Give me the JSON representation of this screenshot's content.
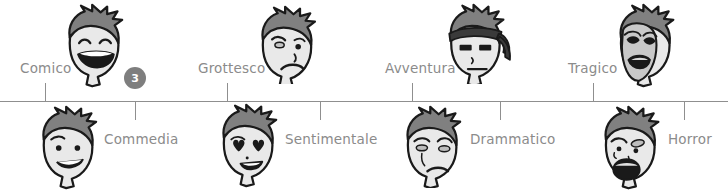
{
  "diagram": {
    "type": "horizontal-scale-timeline",
    "axis_color": "#8f8f8f",
    "label_color": "#8b8b8b",
    "badge_color": "#7e7e7e",
    "skin_color": "#e9e9e9",
    "hair_color": "#808080",
    "outline_color": "#1a1a1a"
  },
  "badge": {
    "value": "3"
  },
  "markers_above": [
    {
      "label": "Comico",
      "tick_x": 45,
      "label_x": 20,
      "label_y": 62,
      "face_x": 62,
      "face_y": 2,
      "face": "laughing-face"
    },
    {
      "label": "Grottesco",
      "tick_x": 227,
      "label_x": 198,
      "label_y": 62,
      "face_x": 255,
      "face_y": 4,
      "face": "grotesque-face"
    },
    {
      "label": "Avventura",
      "tick_x": 412,
      "label_x": 385,
      "label_y": 62,
      "face_x": 443,
      "face_y": 2,
      "face": "adventure-face"
    },
    {
      "label": "Tragico",
      "tick_x": 593,
      "label_x": 568,
      "label_y": 62,
      "face_x": 613,
      "face_y": 2,
      "face": "tragic-mask-face"
    }
  ],
  "markers_below": [
    {
      "label": "Commedia",
      "tick_x": 135,
      "label_x": 104,
      "label_y": 133,
      "face_x": 36,
      "face_y": 104,
      "face": "smiling-face"
    },
    {
      "label": "Sentimentale",
      "tick_x": 320,
      "label_x": 285,
      "label_y": 133,
      "face_x": 216,
      "face_y": 102,
      "face": "love-face"
    },
    {
      "label": "Drammatico",
      "tick_x": 500,
      "label_x": 470,
      "label_y": 133,
      "face_x": 400,
      "face_y": 104,
      "face": "dramatic-face"
    },
    {
      "label": "Horror",
      "tick_x": 684,
      "label_x": 668,
      "label_y": 133,
      "face_x": 598,
      "face_y": 104,
      "face": "horror-face"
    }
  ]
}
